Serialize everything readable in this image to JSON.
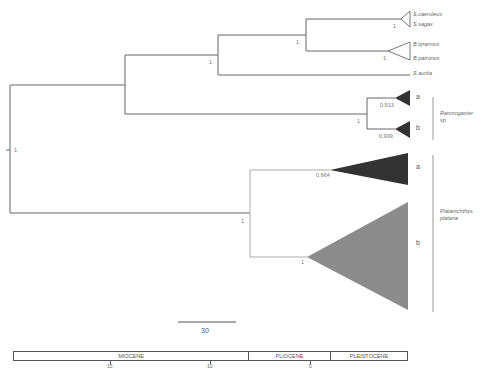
{
  "tree": {
    "taxa": [
      {
        "name": "S.caeruleus"
      },
      {
        "name": "S.sagax"
      },
      {
        "name": "B.tyrannus"
      },
      {
        "name": "B.patronus"
      },
      {
        "name": "S.aurita"
      }
    ],
    "clades": {
      "rhamnogaster_a": "a",
      "rhamnogaster_b": "b",
      "platanichthys_a": "a",
      "platanichthys_b": "b"
    },
    "groups": {
      "rhamnogaster_line1": "Ramnogaster",
      "rhamnogaster_line2": "sp.",
      "platanichthys_line1": "Platanichthys",
      "platanichthys_line2": "platana"
    },
    "support": {
      "root": "1",
      "clupeid_node": "1",
      "sardinops_brevoortia": "1",
      "sardinops": "1",
      "brevoortia": "1",
      "rhamnogaster_platanichthys": "1",
      "rhamnogaster": "1",
      "rhamnogaster_a": "0.913",
      "rhamnogaster_b": "0.999",
      "platanichthys": "1",
      "platanichthys_a": "0.964",
      "platanichthys_b": "1"
    },
    "colors": {
      "branch": "#666666",
      "clade_dark": "#333333",
      "clade_gray": "#8c8c8c"
    }
  },
  "scale_bar": {
    "label": "30"
  },
  "timeline": {
    "epochs": [
      {
        "name": "MIOCENE"
      },
      {
        "name": "PLIOCENE"
      },
      {
        "name": "PLEISTOCENE"
      }
    ],
    "ticks": [
      "15",
      "10",
      "5"
    ]
  }
}
